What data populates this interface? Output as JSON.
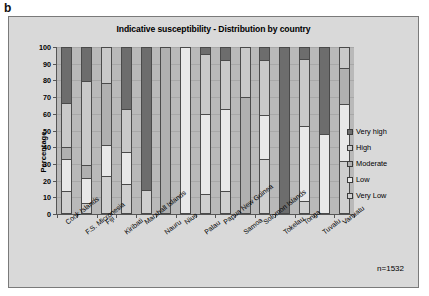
{
  "panel_label": "b",
  "note": "n=1532",
  "legend": {
    "position": "right",
    "items": [
      {
        "label": "Very high",
        "color": "#6d6d6d"
      },
      {
        "label": "High",
        "color": "#c9c9c9"
      },
      {
        "label": "Moderate",
        "color": "#b0b0b0"
      },
      {
        "label": "Low",
        "color": "#e8e8e8"
      },
      {
        "label": "Very Low",
        "color": "#cfcfcf"
      }
    ]
  },
  "chart_data": {
    "type": "bar",
    "subtype": "stacked-percentage-column",
    "title": "Indicative susceptibility - Distribution by country",
    "xlabel": "",
    "ylabel": "Percentage",
    "ylim": [
      0,
      100
    ],
    "yticks": [
      0,
      10,
      20,
      30,
      40,
      50,
      60,
      70,
      80,
      90,
      100
    ],
    "grid": true,
    "categories": [
      "Cook Islands",
      "F.S. Micronesia",
      "Fiji",
      "Kiribati",
      "Marshall Islands",
      "Nauru",
      "Niue",
      "Palau",
      "Papua New Guinea",
      "Samoa",
      "Solomon Islands",
      "Tokelau",
      "Tonga",
      "Tuvalu",
      "Vanuatu"
    ],
    "series": [
      {
        "name": "Very high",
        "color": "#6d6d6d",
        "values": [
          33.5,
          20.0,
          0.0,
          37.0,
          86.0,
          0.0,
          0.0,
          3.5,
          7.5,
          0.0,
          7.0,
          100.0,
          6.5,
          52.0,
          0.0
        ]
      },
      {
        "name": "High",
        "color": "#c9c9c9",
        "values": [
          26.5,
          51.0,
          21.5,
          26.0,
          0.0,
          0.0,
          0.0,
          36.5,
          29.5,
          29.5,
          33.5,
          0.0,
          41.0,
          0.0,
          12.0
        ]
      },
      {
        "name": "Moderate",
        "color": "#b0b0b0",
        "values": [
          7.0,
          8.0,
          37.5,
          0.0,
          0.0,
          100.0,
          0.0,
          0.0,
          0.0,
          70.5,
          0.0,
          0.0,
          0.0,
          0.0,
          22.0
        ]
      },
      {
        "name": "Low",
        "color": "#e8e8e8",
        "values": [
          19.5,
          15.0,
          18.5,
          19.5,
          0.0,
          0.0,
          100.0,
          48.5,
          49.5,
          0.0,
          26.5,
          0.0,
          45.0,
          48.0,
          34.5
        ]
      },
      {
        "name": "Very Low",
        "color": "#cfcfcf",
        "values": [
          13.5,
          6.0,
          22.5,
          17.5,
          14.0,
          0.0,
          0.0,
          11.5,
          13.5,
          0.0,
          33.0,
          0.0,
          7.5,
          0.0,
          31.5
        ]
      }
    ]
  }
}
